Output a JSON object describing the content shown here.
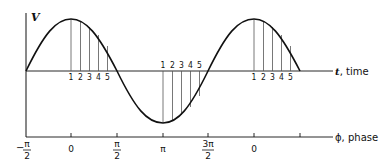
{
  "diagram": {
    "y_axis_label": "V",
    "t_axis_label_var": "t",
    "t_axis_label_text": ", time",
    "phase_axis_label_var": "ϕ",
    "phase_axis_label_text": ", phase",
    "sample_labels": [
      "1",
      "2",
      "3",
      "4",
      "5"
    ],
    "phase_ticks": [
      {
        "num": "π",
        "den": "2",
        "sign": "−",
        "type": "fraction"
      },
      {
        "text": "0",
        "type": "plain"
      },
      {
        "num": "π",
        "den": "2",
        "sign": "",
        "type": "fraction"
      },
      {
        "text": "π",
        "type": "plain"
      },
      {
        "num": "3π",
        "den": "2",
        "sign": "",
        "type": "fraction"
      },
      {
        "text": "0",
        "type": "plain"
      },
      {
        "text": "",
        "type": "plain"
      }
    ],
    "colors": {
      "stroke": "#111111",
      "hatch": "#555555",
      "background": "#ffffff"
    }
  }
}
